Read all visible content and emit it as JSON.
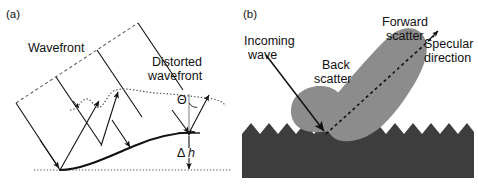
{
  "figure": {
    "width": 478,
    "height": 188,
    "background": "#ffffff",
    "ink_color": "#111111"
  },
  "panel_a": {
    "label": "(a)",
    "labels": {
      "wavefront": "Wavefront",
      "distorted_line1": "Distorted",
      "distorted_line2": "wavefront",
      "theta": "Θ",
      "delta": "Δ",
      "height_symbol": "h"
    },
    "description": "Plane wavefront incident on a rough surface producing a distorted wavefront; height deviation delta-h and scattering angle Theta are marked."
  },
  "panel_b": {
    "label": "(b)",
    "labels": {
      "incoming_line1": "Incoming",
      "incoming_line2": "wave",
      "back_line1": "Back",
      "back_line2": "scatter",
      "forward_line1": "Forward",
      "forward_line2": "scatter",
      "specular_line1": "Specular",
      "specular_line2": "direction"
    },
    "colors": {
      "surface": "#3d3d3d",
      "lobe": "#8c8c8c",
      "lobe_edge": "#8c8c8c"
    },
    "description": "Rough sawtooth surface with incoming wave, a small back-scatter lobe and a large forward-scatter lobe aligned with the dashed specular direction."
  }
}
